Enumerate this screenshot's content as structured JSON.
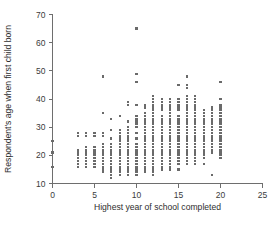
{
  "chart_data": {
    "type": "scatter",
    "title": "",
    "xlabel": "Highest year of school completed",
    "ylabel": "Respondent's age when first child born",
    "xlim": [
      0,
      25
    ],
    "ylim": [
      10,
      70
    ],
    "xticks": [
      0,
      5,
      10,
      15,
      20,
      25
    ],
    "yticks": [
      10,
      20,
      30,
      40,
      50,
      60,
      70
    ],
    "xtick_labels": [
      "0",
      "5",
      "10",
      "15",
      "20",
      "25"
    ],
    "ytick_labels": [
      "10",
      "20",
      "30",
      "40",
      "50",
      "60",
      "70"
    ],
    "grid": false,
    "legend": null,
    "marker": "square",
    "marker_color": "#6a6a6a",
    "axis_color": "#6e6e6e",
    "background": "#ffffff",
    "columns": [
      {
        "x": 0,
        "y": [
          16,
          21,
          25
        ]
      },
      {
        "x": 3,
        "y": [
          16,
          17,
          18,
          19,
          20,
          21,
          22,
          27,
          28
        ]
      },
      {
        "x": 4,
        "y": [
          16,
          17,
          18,
          19,
          20,
          21,
          22,
          23,
          27,
          28
        ]
      },
      {
        "x": 5,
        "y": [
          16,
          17,
          18,
          19,
          20,
          21,
          22,
          23,
          27,
          28
        ]
      },
      {
        "x": 6,
        "y": [
          14,
          15,
          16,
          17,
          18,
          19,
          20,
          21,
          22,
          23,
          24,
          27,
          28,
          35,
          48
        ]
      },
      {
        "x": 7,
        "y": [
          12,
          13,
          14,
          15,
          16,
          17,
          18,
          19,
          20,
          21,
          22,
          23,
          24,
          26,
          29,
          33
        ]
      },
      {
        "x": 8,
        "y": [
          13,
          14,
          15,
          16,
          17,
          18,
          19,
          20,
          21,
          22,
          23,
          24,
          25,
          26,
          27,
          28,
          29,
          34
        ]
      },
      {
        "x": 9,
        "y": [
          13,
          14,
          15,
          16,
          17,
          18,
          19,
          20,
          21,
          22,
          23,
          24,
          25,
          26,
          27,
          28,
          29,
          30,
          32,
          38,
          39
        ]
      },
      {
        "x": 10,
        "y": [
          13,
          14,
          15,
          16,
          17,
          18,
          19,
          20,
          21,
          22,
          23,
          24,
          26,
          28,
          30,
          31,
          32,
          33,
          34,
          38,
          46,
          49,
          65
        ]
      },
      {
        "x": 11,
        "y": [
          14,
          15,
          16,
          17,
          18,
          19,
          20,
          21,
          22,
          23,
          24,
          25,
          26,
          27,
          28,
          29,
          30,
          31,
          32,
          33,
          34,
          35,
          37,
          38
        ]
      },
      {
        "x": 12,
        "y": [
          13,
          14,
          15,
          16,
          17,
          18,
          19,
          20,
          21,
          22,
          23,
          24,
          25,
          26,
          27,
          28,
          29,
          30,
          31,
          32,
          33,
          34,
          35,
          36,
          37,
          38,
          39,
          40,
          41
        ]
      },
      {
        "x": 13,
        "y": [
          15,
          16,
          17,
          18,
          19,
          20,
          21,
          22,
          23,
          24,
          25,
          26,
          27,
          28,
          29,
          30,
          31,
          32,
          33,
          34,
          36,
          37,
          38,
          39,
          40
        ]
      },
      {
        "x": 14,
        "y": [
          15,
          16,
          17,
          18,
          19,
          20,
          21,
          22,
          23,
          24,
          25,
          26,
          27,
          28,
          29,
          30,
          31,
          32,
          33,
          34,
          35,
          36,
          37,
          38,
          39,
          40
        ]
      },
      {
        "x": 15,
        "y": [
          15,
          17,
          18,
          19,
          20,
          21,
          22,
          23,
          24,
          25,
          26,
          27,
          28,
          29,
          30,
          31,
          32,
          33,
          34,
          36,
          37,
          38,
          39,
          40,
          45
        ]
      },
      {
        "x": 16,
        "y": [
          17,
          18,
          19,
          20,
          21,
          22,
          23,
          24,
          25,
          26,
          27,
          28,
          29,
          30,
          31,
          32,
          33,
          34,
          35,
          36,
          37,
          38,
          39,
          40,
          41,
          44,
          45,
          48
        ]
      },
      {
        "x": 17,
        "y": [
          17,
          18,
          19,
          20,
          21,
          22,
          23,
          24,
          25,
          26,
          27,
          28,
          29,
          30,
          31,
          32,
          33,
          34,
          35,
          36,
          37,
          38,
          39,
          40,
          41
        ]
      },
      {
        "x": 18,
        "y": [
          17,
          19,
          20,
          21,
          22,
          23,
          24,
          25,
          26,
          27,
          28,
          29,
          30,
          31,
          32,
          33,
          34,
          35,
          36
        ]
      },
      {
        "x": 19,
        "y": [
          13,
          21,
          22,
          23,
          24,
          25,
          26,
          27,
          28,
          29,
          30,
          31,
          32,
          33,
          34,
          35,
          36,
          37
        ]
      },
      {
        "x": 20,
        "y": [
          19,
          20,
          21,
          22,
          23,
          24,
          25,
          26,
          27,
          28,
          29,
          30,
          31,
          32,
          33,
          34,
          35,
          36,
          37,
          38,
          40,
          46
        ]
      }
    ]
  }
}
